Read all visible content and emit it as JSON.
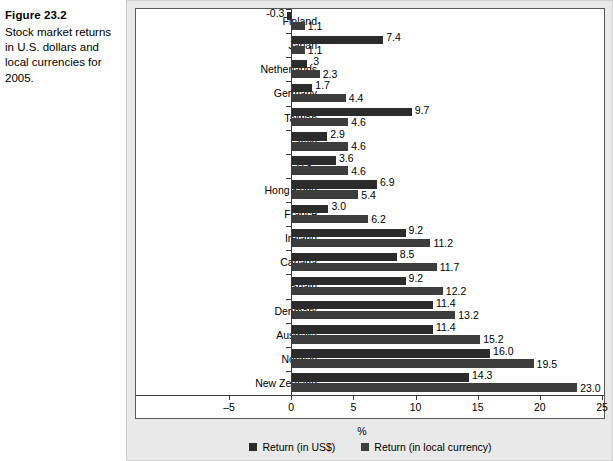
{
  "figure": {
    "number": "Figure 23.2",
    "description": "Stock market returns in U.S. dollars and local currencies for 2005."
  },
  "colors": {
    "usd_bar": "#2b2b2b",
    "local_bar": "#3d3d3d",
    "panel_background": "#e9e9e9",
    "plot_background": "#ffffff",
    "axis": "#3a3a3a"
  },
  "legend": {
    "position": "bottom",
    "items": [
      {
        "label": "Return (in US$)",
        "swatch": "usd"
      },
      {
        "label": "Return (in local currency)",
        "swatch": "loc"
      }
    ]
  },
  "axis": {
    "xlabel": "%",
    "ticks": [
      "-5",
      "0",
      "5",
      "10",
      "15",
      "20",
      "25"
    ],
    "tick_values": [
      -5,
      0,
      5,
      10,
      15,
      20,
      25
    ],
    "min": -5,
    "max": 25
  },
  "chart_data": {
    "type": "bar",
    "orientation": "horizontal",
    "title": "Stock market returns in U.S. dollars and local currencies for 2005.",
    "xlabel": "%",
    "ylabel": "",
    "xlim": [
      -5,
      25
    ],
    "grid": false,
    "legend_position": "bottom",
    "categories": [
      "Finland",
      "Japan",
      "Netherlands",
      "Germany",
      "Taiwan",
      "Italy",
      "U.K.",
      "Hong Kong",
      "France",
      "Ireland",
      "Canada",
      "Spain",
      "Denmark",
      "Australia",
      "Norway",
      "New Zealand"
    ],
    "series": [
      {
        "name": "Return (in US$)",
        "values": [
          -0.3,
          7.4,
          1.3,
          1.7,
          9.7,
          2.9,
          3.6,
          6.9,
          3.0,
          9.2,
          8.5,
          9.2,
          11.4,
          11.4,
          16.0,
          14.3
        ],
        "labels": [
          "-0.3",
          "7.4",
          ".3",
          "1.7",
          "9.7",
          "2.9",
          "3.6",
          "6.9",
          "3.0",
          "9.2",
          "8.5",
          "9.2",
          "11.4",
          "11.4",
          "16.0",
          "14.3"
        ]
      },
      {
        "name": "Return (in local currency)",
        "values": [
          1.1,
          1.1,
          2.3,
          4.4,
          4.6,
          4.6,
          4.6,
          5.4,
          6.2,
          11.2,
          11.7,
          12.2,
          13.2,
          15.2,
          19.5,
          23.0
        ],
        "labels": [
          "1.1",
          "1.1",
          "2.3",
          "4.4",
          "4.6",
          "4.6",
          "4.6",
          "5.4",
          "6.2",
          "11.2",
          "11.7",
          "12.2",
          "13.2",
          "15.2",
          "19.5",
          "23.0"
        ]
      }
    ]
  }
}
